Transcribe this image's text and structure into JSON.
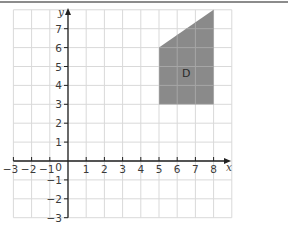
{
  "chart_data": {
    "type": "diagram-coordinate-grid",
    "title": "",
    "xlabel": "x",
    "ylabel": "y",
    "xlim": [
      -3,
      9
    ],
    "ylim": [
      -3,
      8
    ],
    "x_ticks": [
      -3,
      -2,
      -1,
      1,
      2,
      3,
      4,
      5,
      6,
      7,
      8
    ],
    "y_ticks": [
      -3,
      -2,
      -1,
      1,
      2,
      3,
      4,
      5,
      6,
      7
    ],
    "origin_label": "0",
    "grid": true,
    "shapes": [
      {
        "label": "D",
        "vertices": [
          [
            5,
            3
          ],
          [
            5,
            6
          ],
          [
            8,
            8
          ],
          [
            8,
            3
          ]
        ],
        "fill": "#8a8a8a"
      }
    ]
  },
  "colors": {
    "grid": "#d9d9d9",
    "axis": "#222222",
    "shape_fill": "#8a8a8a",
    "border": "#8c8c8c"
  }
}
